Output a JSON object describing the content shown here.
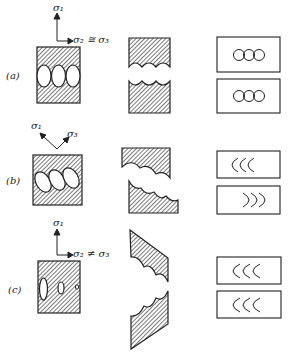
{
  "diagram": {
    "type": "fracture-mode-illustration",
    "cases": [
      {
        "id": "a",
        "label": "(a)",
        "stress_labels": {
          "sigma1": "σ₁",
          "lateral": "σ₂ ≅ σ₃"
        },
        "void_shape": "three equal ellipses",
        "fracture": "flat, cup-cup (equiaxed dimples)",
        "dimple_glyphs_top": "OOO",
        "dimple_glyphs_bottom": "OOO"
      },
      {
        "id": "b",
        "label": "(b)",
        "stress_labels": {
          "sigma1": "σ₁",
          "sigma3": "σ₃"
        },
        "void_shape": "three tilted ellipses",
        "fracture": "inclined shear",
        "dimple_glyphs_top": "CCC",
        "dimple_glyphs_bottom": "ↄↄↄ"
      },
      {
        "id": "c",
        "label": "(c)",
        "stress_labels": {
          "sigma1": "σ₁",
          "lateral": "σ₂ ≠ σ₃"
        },
        "void_shape": "elongated voids of decreasing size",
        "fracture": "tearing",
        "dimple_glyphs_top": "CCC",
        "dimple_glyphs_bottom": "CCC"
      }
    ]
  },
  "colors": {
    "ink": "#222222",
    "background": "#ffffff"
  }
}
